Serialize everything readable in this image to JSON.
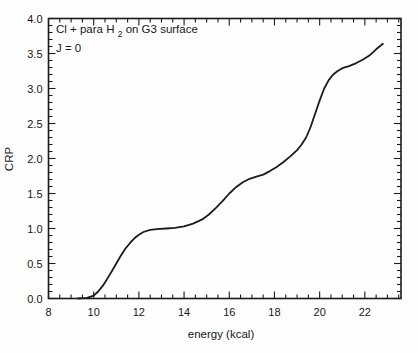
{
  "figure": {
    "background": "#fefefe",
    "ink": "#1a1a1a"
  },
  "annotation": {
    "line1_prefix": "Cl + para H",
    "line1_sub": "2",
    "line1_suffix": " on G3 surface",
    "line2": "J = 0"
  },
  "chart_data": {
    "type": "line",
    "xlabel": "energy (kcal)",
    "ylabel": "CRP",
    "xlim": [
      8,
      23.6
    ],
    "ylim": [
      0,
      4
    ],
    "grid": false,
    "legend": null,
    "x_major_ticks": [
      8,
      10,
      12,
      14,
      16,
      18,
      20,
      22
    ],
    "x_tick_labels": [
      "8",
      "10",
      "12",
      "14",
      "16",
      "18",
      "20",
      "22"
    ],
    "x_minor_step": 0.5,
    "y_major_ticks": [
      0,
      0.5,
      1,
      1.5,
      2,
      2.5,
      3,
      3.5,
      4
    ],
    "y_tick_labels": [
      "0.0",
      "0.5",
      "1.0",
      "1.5",
      "2.0",
      "2.5",
      "3.0",
      "3.5",
      "4.0"
    ],
    "y_minor_step": 0.1,
    "series": [
      {
        "name": "CRP",
        "color": "#1c1c1c",
        "points": [
          [
            9.3,
            0.0
          ],
          [
            9.7,
            0.01
          ],
          [
            10.0,
            0.04
          ],
          [
            10.2,
            0.1
          ],
          [
            10.4,
            0.18
          ],
          [
            10.6,
            0.28
          ],
          [
            10.8,
            0.39
          ],
          [
            11.0,
            0.5
          ],
          [
            11.2,
            0.61
          ],
          [
            11.4,
            0.71
          ],
          [
            11.6,
            0.79
          ],
          [
            11.8,
            0.86
          ],
          [
            12.0,
            0.91
          ],
          [
            12.2,
            0.95
          ],
          [
            12.5,
            0.98
          ],
          [
            12.8,
            0.99
          ],
          [
            13.2,
            1.0
          ],
          [
            13.6,
            1.01
          ],
          [
            14.0,
            1.03
          ],
          [
            14.4,
            1.07
          ],
          [
            14.8,
            1.13
          ],
          [
            15.1,
            1.2
          ],
          [
            15.4,
            1.29
          ],
          [
            15.7,
            1.39
          ],
          [
            16.0,
            1.5
          ],
          [
            16.3,
            1.59
          ],
          [
            16.6,
            1.66
          ],
          [
            16.9,
            1.71
          ],
          [
            17.2,
            1.74
          ],
          [
            17.5,
            1.77
          ],
          [
            17.8,
            1.82
          ],
          [
            18.1,
            1.88
          ],
          [
            18.4,
            1.95
          ],
          [
            18.7,
            2.03
          ],
          [
            19.0,
            2.12
          ],
          [
            19.2,
            2.2
          ],
          [
            19.4,
            2.3
          ],
          [
            19.6,
            2.45
          ],
          [
            19.8,
            2.64
          ],
          [
            20.0,
            2.83
          ],
          [
            20.2,
            3.0
          ],
          [
            20.4,
            3.12
          ],
          [
            20.6,
            3.2
          ],
          [
            20.8,
            3.25
          ],
          [
            21.0,
            3.29
          ],
          [
            21.3,
            3.32
          ],
          [
            21.6,
            3.36
          ],
          [
            21.9,
            3.41
          ],
          [
            22.2,
            3.47
          ],
          [
            22.5,
            3.56
          ],
          [
            22.8,
            3.64
          ]
        ]
      }
    ]
  }
}
